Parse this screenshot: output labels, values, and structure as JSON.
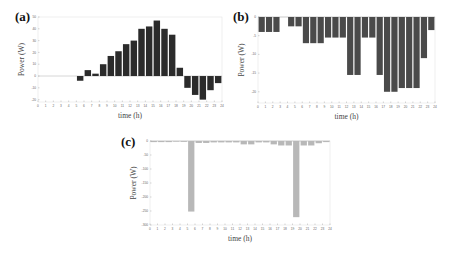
{
  "chart_data": [
    {
      "panel": "(a)",
      "type": "bar",
      "title": "",
      "xlabel": "time (h)",
      "ylabel": "Power (W)",
      "x": [
        0,
        1,
        2,
        3,
        4,
        5,
        6,
        7,
        8,
        9,
        10,
        11,
        12,
        13,
        14,
        15,
        16,
        17,
        18,
        19,
        20,
        21,
        22,
        23
      ],
      "values": [
        0,
        0,
        0,
        0,
        0,
        -4,
        5,
        2,
        10,
        17,
        21,
        27,
        30,
        40,
        42,
        47,
        40,
        35,
        7,
        -10,
        -16,
        -20,
        -12,
        -6
      ],
      "xticks": [
        0,
        1,
        2,
        3,
        4,
        5,
        6,
        7,
        8,
        9,
        10,
        11,
        12,
        13,
        14,
        15,
        16,
        17,
        18,
        19,
        20,
        21,
        22,
        23,
        24
      ],
      "yticks": [
        50,
        40,
        30,
        20,
        10,
        0,
        -10,
        -20
      ],
      "xlim": [
        0,
        24
      ],
      "ylim": [
        -22,
        50
      ],
      "bar_color": "#2b2b2b",
      "grid": false
    },
    {
      "panel": "(b)",
      "type": "bar",
      "title": "",
      "xlabel": "time (h)",
      "ylabel": "Power (W)",
      "x": [
        0,
        1,
        2,
        3,
        4,
        5,
        6,
        7,
        8,
        9,
        10,
        11,
        12,
        13,
        14,
        15,
        16,
        17,
        18,
        19,
        20,
        21,
        22,
        23
      ],
      "values": [
        -4,
        -4,
        -4,
        0,
        -2.5,
        -2.5,
        -7,
        -7,
        -7,
        -5.5,
        -5.5,
        -5.5,
        -15.5,
        -15.5,
        -5.5,
        -5.5,
        -15.5,
        -20,
        -20,
        -19,
        -19,
        -19,
        -11,
        -3.5
      ],
      "xticks": [
        0,
        1,
        2,
        3,
        4,
        5,
        6,
        7,
        8,
        9,
        10,
        11,
        12,
        13,
        14,
        15,
        16,
        17,
        18,
        19,
        20,
        21,
        22,
        23,
        24
      ],
      "yticks": [
        0,
        -5,
        -10,
        -15,
        -20
      ],
      "xlim": [
        0,
        24
      ],
      "ylim": [
        -23,
        0
      ],
      "bar_color": "#4a4a4a",
      "grid": false
    },
    {
      "panel": "(c)",
      "type": "bar",
      "title": "",
      "xlabel": "time (h)",
      "ylabel": "Power (W)",
      "x": [
        0,
        1,
        2,
        3,
        4,
        5,
        6,
        7,
        8,
        9,
        10,
        11,
        12,
        13,
        14,
        15,
        16,
        17,
        18,
        19,
        20,
        21,
        22,
        23
      ],
      "values": [
        -4,
        -4,
        -4,
        -1,
        -3,
        -252,
        -7,
        -7,
        -5,
        -5,
        -5,
        -5,
        -12,
        -12,
        -5,
        -5,
        -12,
        -16,
        -16,
        -272,
        -16,
        -16,
        -8,
        -4
      ],
      "xticks": [
        0,
        1,
        2,
        3,
        4,
        5,
        6,
        7,
        8,
        9,
        10,
        11,
        12,
        13,
        14,
        15,
        16,
        17,
        18,
        19,
        20,
        21,
        22,
        23,
        24
      ],
      "yticks": [
        0,
        -50,
        -100,
        -150,
        -200,
        -250,
        -300
      ],
      "xlim": [
        0,
        24
      ],
      "ylim": [
        -300,
        0
      ],
      "bar_color": "#b8b8b8",
      "grid": false
    }
  ],
  "panels": {
    "a": {
      "label": "(a)",
      "xlabel": "time (h)",
      "ylabel": "Power (W)"
    },
    "b": {
      "label": "(b)",
      "xlabel": "time (h)",
      "ylabel": "Power (W)"
    },
    "c": {
      "label": "(c)",
      "xlabel": "time (h)",
      "ylabel": "Power (W)"
    }
  }
}
